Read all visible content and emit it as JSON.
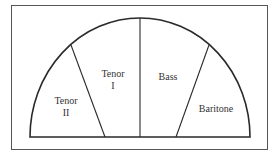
{
  "diagram": {
    "type": "semicircle-seating-chart",
    "sections": [
      {
        "id": "tenor-ii",
        "line1": "Tenor",
        "line2": "II"
      },
      {
        "id": "tenor-i",
        "line1": "Tenor",
        "line2": "I"
      },
      {
        "id": "bass",
        "line1": "Bass"
      },
      {
        "id": "baritone",
        "line1": "Baritone"
      }
    ],
    "colors": {
      "line": "#2a2a2a",
      "frame": "#555555",
      "background": "#ffffff"
    }
  }
}
